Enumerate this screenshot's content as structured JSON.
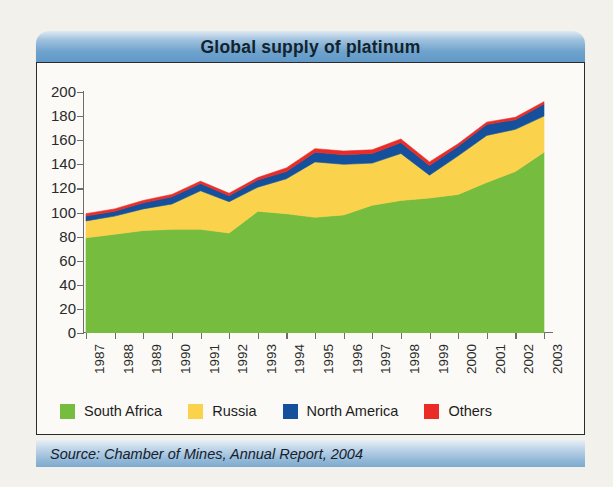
{
  "header": {
    "title": "Global supply of platinum"
  },
  "footer": {
    "source": "Source: Chamber of Mines, Annual Report, 2004"
  },
  "legend": {
    "items": [
      {
        "label": "South Africa",
        "color": "#76bc3f"
      },
      {
        "label": "Russia",
        "color": "#fbd24b"
      },
      {
        "label": "North America",
        "color": "#14509c"
      },
      {
        "label": "Others",
        "color": "#ea2b26"
      }
    ]
  },
  "chart_data": {
    "type": "area",
    "stacked": true,
    "title": "Global supply of platinum",
    "xlabel": "",
    "ylabel": "",
    "ylim": [
      0,
      200
    ],
    "ytick_step": 20,
    "yticks": [
      0,
      20,
      40,
      60,
      80,
      100,
      120,
      140,
      160,
      180,
      200
    ],
    "grid": false,
    "legend_position": "bottom",
    "source": "Source: Chamber of Mines, Annual Report, 2004",
    "categories": [
      "1987",
      "1988",
      "1989",
      "1990",
      "1991",
      "1992",
      "1993",
      "1994",
      "1995",
      "1996",
      "1997",
      "1998",
      "1999",
      "2000",
      "2001",
      "2002",
      "2003"
    ],
    "series": [
      {
        "name": "South Africa",
        "color": "#76bc3f",
        "values": [
          79,
          82,
          85,
          86,
          86,
          83,
          101,
          99,
          96,
          98,
          106,
          110,
          112,
          115,
          125,
          134,
          150
        ]
      },
      {
        "name": "Russia",
        "color": "#fbd24b",
        "values": [
          14,
          15,
          18,
          21,
          32,
          26,
          20,
          29,
          46,
          42,
          35,
          39,
          19,
          32,
          39,
          35,
          30
        ]
      },
      {
        "name": "North America",
        "color": "#14509c",
        "values": [
          4,
          4,
          5,
          6,
          6,
          5,
          6,
          6,
          8,
          8,
          8,
          9,
          8,
          8,
          9,
          8,
          10
        ]
      },
      {
        "name": "Others",
        "color": "#ea2b26",
        "values": [
          2,
          2,
          2,
          2,
          2,
          2,
          2,
          3,
          3,
          3,
          3,
          3,
          3,
          2,
          2,
          2,
          2
        ]
      }
    ],
    "totals": [
      99,
      103,
      110,
      115,
      126,
      116,
      129,
      137,
      153,
      151,
      152,
      161,
      142,
      157,
      175,
      179,
      192
    ]
  }
}
